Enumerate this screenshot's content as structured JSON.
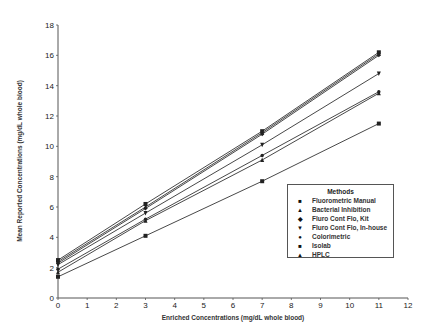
{
  "chart_data": {
    "type": "line",
    "title": "",
    "xlabel": "Enriched Concentrations (mg/dL whole blood)",
    "ylabel": "Mean Reported Concentrations (mg/dL whole blood)",
    "xlim": [
      0,
      12
    ],
    "ylim": [
      0,
      18
    ],
    "x_ticks": [
      0,
      1,
      2,
      3,
      4,
      5,
      6,
      7,
      8,
      9,
      10,
      11,
      12
    ],
    "y_ticks": [
      0,
      2,
      4,
      6,
      8,
      10,
      12,
      14,
      16,
      18
    ],
    "grid": false,
    "legend_position": "lower right (inside)",
    "legend_title": "Methods",
    "x": [
      0,
      3,
      7,
      11
    ],
    "series": [
      {
        "name": "Fluorometric Manual",
        "marker": "square",
        "values": [
          2.5,
          6.2,
          11.0,
          16.2
        ]
      },
      {
        "name": "Bacterial Inhibition",
        "marker": "triangle-up",
        "values": [
          2.4,
          6.0,
          10.9,
          16.1
        ]
      },
      {
        "name": "Fluro Cont Flo, Kit",
        "marker": "diamond",
        "values": [
          2.3,
          5.9,
          10.8,
          16.0
        ]
      },
      {
        "name": "Fluro Cont Flo, In-house",
        "marker": "triangle-down",
        "values": [
          2.2,
          5.6,
          10.1,
          14.8
        ]
      },
      {
        "name": "Colorimetric",
        "marker": "circle",
        "values": [
          1.9,
          5.2,
          9.4,
          13.6
        ]
      },
      {
        "name": "Isolab",
        "marker": "square",
        "values": [
          1.4,
          4.1,
          7.7,
          11.5
        ]
      },
      {
        "name": "HPLC",
        "marker": "triangle-up",
        "values": [
          1.7,
          5.1,
          9.1,
          13.5
        ]
      }
    ]
  },
  "legend": {
    "title": "Methods",
    "items": [
      {
        "label": "Fluorometric Manual",
        "glyph": "■"
      },
      {
        "label": "Bacterial Inhibition",
        "glyph": "▲"
      },
      {
        "label": "Fluro Cont Flo, Kit",
        "glyph": "◆"
      },
      {
        "label": "Fluro Cont Flo, In-house",
        "glyph": "▼"
      },
      {
        "label": "Colorimetric",
        "glyph": "●"
      },
      {
        "label": "Isolab",
        "glyph": "■"
      },
      {
        "label": "HPLC",
        "glyph": "▲"
      }
    ]
  },
  "axes": {
    "xlabel": "Enriched Concentrations (mg/dL whole blood)",
    "ylabel": "Mean Reported Concentrations (mg/dL whole blood)"
  }
}
